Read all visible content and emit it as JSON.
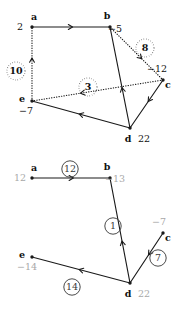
{
  "figure": {
    "title": "",
    "panels": [
      {
        "id": "top-graph",
        "name": "graph-with-dotted-and-solid-edges",
        "nodes": [
          {
            "id": "a",
            "label": "a",
            "value": "2",
            "x": 32,
            "y": 27,
            "label_dx": 2,
            "label_dy": -7,
            "value_dx": -12,
            "value_dy": 3,
            "value_style": "dark"
          },
          {
            "id": "b",
            "label": "b",
            "value": "−5",
            "x": 110,
            "y": 27,
            "label_dx": -3,
            "label_dy": -8,
            "value_dx": 5,
            "value_dy": 5,
            "value_style": "dark"
          },
          {
            "id": "c",
            "label": "c",
            "value": "−12",
            "x": 163,
            "y": 80,
            "label_dx": 5,
            "label_dy": 8,
            "value_dx": -6,
            "value_dy": -8,
            "value_style": "dark"
          },
          {
            "id": "d",
            "label": "d",
            "value": "22",
            "x": 130,
            "y": 128,
            "label_dx": -2,
            "label_dy": 14,
            "value_dx": 14,
            "value_dy": 14,
            "value_style": "dark"
          },
          {
            "id": "e",
            "label": "e",
            "value": "−7",
            "x": 32,
            "y": 101,
            "label_dx": -10,
            "label_dy": 1,
            "value_dx": -6,
            "value_dy": 13,
            "value_style": "dark"
          }
        ],
        "edges": [
          {
            "from": "a",
            "to": "b",
            "style": "solid",
            "arrow_at": 0.52,
            "arrow_dir": "forward",
            "weight": null
          },
          {
            "from": "e",
            "to": "a",
            "style": "dotted",
            "arrow_at": 0.58,
            "arrow_dir": "forward",
            "weight": "10",
            "wx": 16,
            "wy": 71
          },
          {
            "from": "b",
            "to": "d",
            "style": "solid",
            "arrow_at": 0.6,
            "arrow_dir": "backward",
            "weight": null
          },
          {
            "from": "b",
            "to": "c",
            "style": "dotted",
            "arrow_at": 0.6,
            "arrow_dir": "forward",
            "weight": "8",
            "wx": 145,
            "wy": 48
          },
          {
            "from": "c",
            "to": "e",
            "style": "dotted",
            "arrow_at": 0.63,
            "arrow_dir": "forward",
            "weight": "3",
            "wx": 88,
            "wy": 87
          },
          {
            "from": "d",
            "to": "c",
            "style": "solid",
            "arrow_at": 0.55,
            "arrow_dir": "backward",
            "weight": null
          },
          {
            "from": "d",
            "to": "e",
            "style": "solid",
            "arrow_at": 0.52,
            "arrow_dir": "forward",
            "weight": null
          }
        ]
      },
      {
        "id": "bottom-graph",
        "name": "shortest-path-tree-graph",
        "nodes": [
          {
            "id": "a",
            "label": "a",
            "value": "12",
            "x": 32,
            "y": 178,
            "label_dx": 2,
            "label_dy": -7,
            "value_dx": -12,
            "value_dy": 3,
            "value_style": "gray"
          },
          {
            "id": "b",
            "label": "b",
            "value": "−13",
            "x": 110,
            "y": 178,
            "label_dx": -3,
            "label_dy": -8,
            "value_dx": 5,
            "value_dy": 4,
            "value_style": "gray"
          },
          {
            "id": "c",
            "label": "c",
            "value": "−7",
            "x": 163,
            "y": 233,
            "label_dx": 5,
            "label_dy": 8,
            "value_dx": -4,
            "value_dy": -8,
            "value_style": "gray"
          },
          {
            "id": "d",
            "label": "d",
            "value": "22",
            "x": 130,
            "y": 283,
            "label_dx": -2,
            "label_dy": 14,
            "value_dx": 14,
            "value_dy": 14,
            "value_style": "gray"
          },
          {
            "id": "e",
            "label": "e",
            "value": "−14",
            "x": 32,
            "y": 257,
            "label_dx": -10,
            "label_dy": 1,
            "value_dx": -5,
            "value_dy": 13,
            "value_style": "gray"
          }
        ],
        "edges": [
          {
            "from": "a",
            "to": "b",
            "style": "solid",
            "arrow_at": 0.53,
            "arrow_dir": "forward",
            "weight": "12",
            "wx": 70,
            "wy": 169
          },
          {
            "from": "b",
            "to": "d",
            "style": "solid",
            "arrow_at": 0.6,
            "arrow_dir": "backward",
            "weight": "1",
            "wx": 113,
            "wy": 226
          },
          {
            "from": "d",
            "to": "c",
            "style": "solid",
            "arrow_at": 0.56,
            "arrow_dir": "backward",
            "weight": "7",
            "wx": 158,
            "wy": 258
          },
          {
            "from": "d",
            "to": "e",
            "style": "solid",
            "arrow_at": 0.52,
            "arrow_dir": "forward",
            "weight": "14",
            "wx": 72,
            "wy": 287
          }
        ]
      }
    ]
  }
}
